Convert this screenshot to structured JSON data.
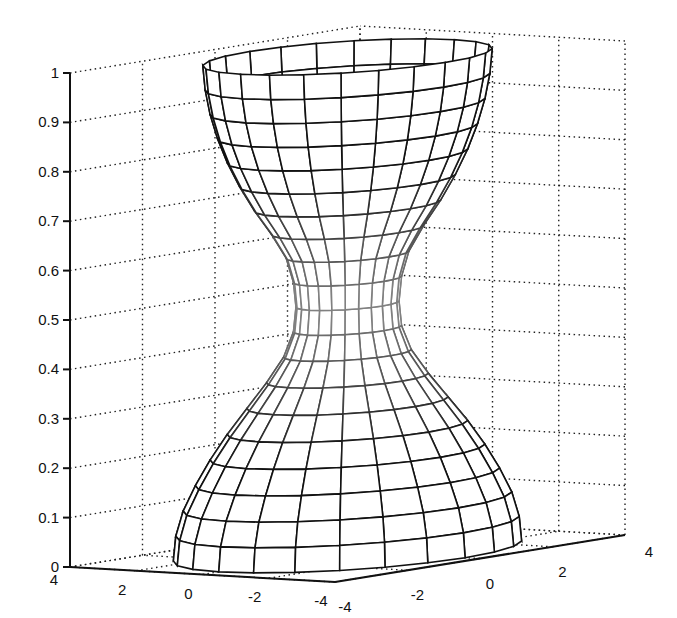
{
  "chart_data": {
    "type": "surface3d",
    "title": "",
    "xlabel": "",
    "ylabel": "",
    "zlabel": "",
    "xlim": [
      -4,
      4
    ],
    "ylim": [
      -4,
      4
    ],
    "zlim": [
      0,
      1
    ],
    "x_ticks": [
      -4,
      -2,
      0,
      2,
      4
    ],
    "y_ticks": [
      -4,
      -2,
      0,
      2,
      4
    ],
    "z_ticks": [
      0,
      0.1,
      0.2,
      0.3,
      0.4,
      0.5,
      0.6,
      0.7,
      0.8,
      0.9,
      1
    ],
    "x_tick_labels": [
      "-4",
      "-2",
      "0",
      "2",
      "4"
    ],
    "y_tick_labels": [
      "-4",
      "-2",
      "0",
      "2",
      "4"
    ],
    "z_tick_labels": [
      "0",
      "0.1",
      "0.2",
      "0.3",
      "0.4",
      "0.5",
      "0.6",
      "0.7",
      "0.8",
      "0.9",
      "1"
    ],
    "grid": true,
    "grid_style": "dotted",
    "profile": {
      "z": [
        0,
        0.05,
        0.1,
        0.15,
        0.2,
        0.25,
        0.3,
        0.35,
        0.4,
        0.45,
        0.5,
        0.55,
        0.6,
        0.65,
        0.7,
        0.75,
        0.8,
        0.85,
        0.9,
        0.95,
        1
      ],
      "radius": [
        3.55,
        3.5,
        3.35,
        3.1,
        2.8,
        2.45,
        2.05,
        1.65,
        1.3,
        1.1,
        1.05,
        1.1,
        1.25,
        1.55,
        1.9,
        2.2,
        2.45,
        2.65,
        2.8,
        2.9,
        2.95
      ]
    },
    "angular_segments": 24,
    "mesh_color_edge": "#111111",
    "mesh_color_center": "#8a8a8a"
  }
}
